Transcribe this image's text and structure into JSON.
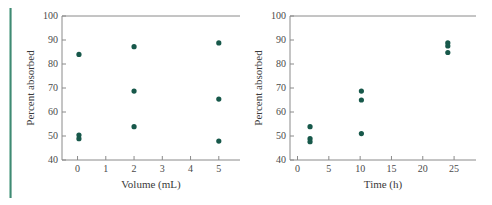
{
  "figure": {
    "background_color": "#ffffff",
    "marker_color": "#17584a",
    "axis_color": "#8a8a8a",
    "edge_rule_color": "#4e9b84",
    "panel_count": 2
  },
  "chart_data": [
    {
      "type": "scatter",
      "panel": "left",
      "title": "",
      "xlabel": "Volume (mL)",
      "ylabel": "Percent absorbed",
      "xlim": [
        -0.55,
        5.75
      ],
      "ylim": [
        40,
        100
      ],
      "xticks": [
        0,
        1,
        2,
        3,
        4,
        5
      ],
      "xticklabels": [
        "0",
        "1",
        "2",
        "3",
        "4",
        "5"
      ],
      "yticks": [
        40,
        50,
        60,
        70,
        80,
        90,
        100
      ],
      "yticklabels": [
        "40",
        "50",
        "60",
        "70",
        "80",
        "90",
        "100"
      ],
      "grid": false,
      "legend": false,
      "x": [
        0.05,
        0.05,
        0.05,
        2.0,
        2.0,
        2.0,
        5.0,
        5.0,
        5.0
      ],
      "y": [
        84.0,
        50.4,
        48.9,
        87.2,
        68.7,
        53.9,
        88.8,
        65.4,
        47.9
      ],
      "points": [
        {
          "x": 0.05,
          "y": 84.0
        },
        {
          "x": 0.05,
          "y": 50.4
        },
        {
          "x": 0.05,
          "y": 48.9
        },
        {
          "x": 2.0,
          "y": 87.2
        },
        {
          "x": 2.0,
          "y": 68.7
        },
        {
          "x": 2.0,
          "y": 53.9
        },
        {
          "x": 5.0,
          "y": 88.8
        },
        {
          "x": 5.0,
          "y": 65.4
        },
        {
          "x": 5.0,
          "y": 47.9
        }
      ]
    },
    {
      "type": "scatter",
      "panel": "right",
      "title": "",
      "xlabel": "Time (h)",
      "ylabel": "Percent absorbed",
      "xlim": [
        -1.2,
        28.5
      ],
      "ylim": [
        40,
        100
      ],
      "xticks": [
        0,
        5,
        10,
        15,
        20,
        25
      ],
      "xticklabels": [
        "0",
        "5",
        "10",
        "15",
        "20",
        "25"
      ],
      "yticks": [
        40,
        50,
        60,
        70,
        80,
        90,
        100
      ],
      "yticklabels": [
        "40",
        "50",
        "60",
        "70",
        "80",
        "90",
        "100"
      ],
      "grid": false,
      "legend": false,
      "x": [
        2.0,
        2.0,
        2.0,
        10.2,
        10.2,
        10.2,
        24.0,
        24.0,
        24.0
      ],
      "y": [
        53.9,
        48.9,
        47.6,
        68.7,
        65.0,
        51.0,
        88.8,
        87.5,
        84.8
      ],
      "points": [
        {
          "x": 2.0,
          "y": 53.9
        },
        {
          "x": 2.0,
          "y": 48.9
        },
        {
          "x": 2.0,
          "y": 47.6
        },
        {
          "x": 10.2,
          "y": 68.7
        },
        {
          "x": 10.2,
          "y": 65.0
        },
        {
          "x": 10.2,
          "y": 51.0
        },
        {
          "x": 24.0,
          "y": 88.8
        },
        {
          "x": 24.0,
          "y": 87.5
        },
        {
          "x": 24.0,
          "y": 84.8
        }
      ]
    }
  ]
}
